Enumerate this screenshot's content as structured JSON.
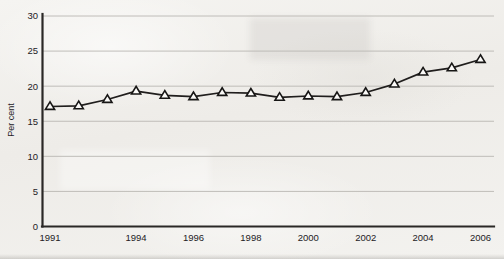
{
  "chart_data": {
    "type": "line",
    "title": "",
    "xlabel": "",
    "ylabel": "Per cent",
    "x": [
      1991,
      1992,
      1993,
      1994,
      1995,
      1996,
      1997,
      1998,
      1999,
      2000,
      2001,
      2002,
      2003,
      2004,
      2005,
      2006
    ],
    "values": [
      17.1,
      17.2,
      18.1,
      19.3,
      18.7,
      18.5,
      19.1,
      19.0,
      18.4,
      18.6,
      18.5,
      19.1,
      20.3,
      22.0,
      22.6,
      23.8
    ],
    "series": [
      {
        "name": "Per cent",
        "values": [
          17.1,
          17.2,
          18.1,
          19.3,
          18.7,
          18.5,
          19.1,
          19.0,
          18.4,
          18.6,
          18.5,
          19.1,
          20.3,
          22.0,
          22.6,
          23.8
        ]
      }
    ],
    "xlim": [
      1991,
      2006
    ],
    "ylim": [
      0,
      30
    ],
    "y_ticks": [
      0,
      5,
      10,
      15,
      20,
      25,
      30
    ],
    "y_tick_labels": [
      "0",
      "5",
      "10",
      "15",
      "20",
      "25",
      "30"
    ],
    "x_ticks": [
      1991,
      1994,
      1996,
      1998,
      2000,
      2002,
      2004,
      2006
    ],
    "x_tick_labels": [
      "1991",
      "1994",
      "1996",
      "1998",
      "2000",
      "2002",
      "2004",
      "2006"
    ],
    "grid": "horizontal",
    "legend": "none",
    "marker": "open-triangle",
    "line_color": "#201e1d",
    "marker_fill": "#fbfaf8",
    "marker_edge_color": "#171615",
    "grid_color": "#b9b7b2",
    "axis_color": "#2a2826",
    "background_color": "#f2f1ee"
  }
}
